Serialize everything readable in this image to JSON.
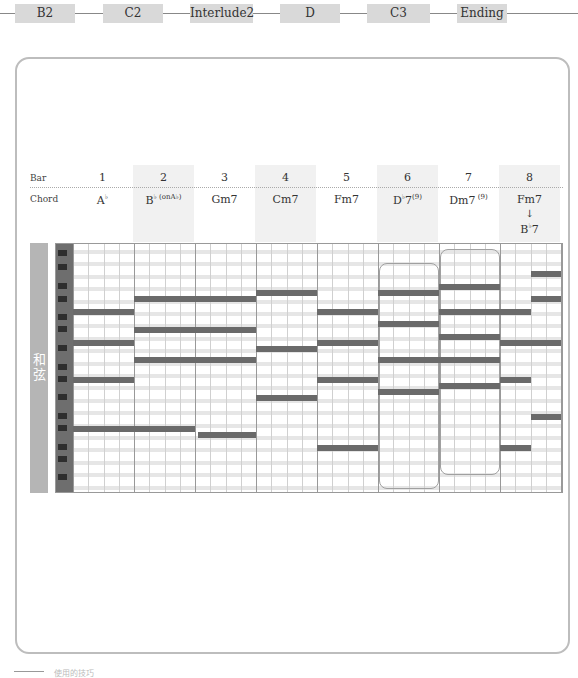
{
  "sections": [
    {
      "label": "B2"
    },
    {
      "label": "C2"
    },
    {
      "label": "Interlude2"
    },
    {
      "label": "D"
    },
    {
      "label": "C3"
    },
    {
      "label": "Ending"
    }
  ],
  "table": {
    "bar_label": "Bar",
    "chord_label": "Chord",
    "bars": [
      {
        "number": "1",
        "chord": "A",
        "chord_acc": "♭",
        "chord_ext": "",
        "shaded": false
      },
      {
        "number": "2",
        "chord": "B",
        "chord_acc": "♭",
        "chord_ext": "(onA♭)",
        "shaded": true
      },
      {
        "number": "3",
        "chord": "Gm7",
        "chord_acc": "",
        "chord_ext": "",
        "shaded": false
      },
      {
        "number": "4",
        "chord": "Cm7",
        "chord_acc": "",
        "chord_ext": "",
        "shaded": true
      },
      {
        "number": "5",
        "chord": "Fm7",
        "chord_acc": "",
        "chord_ext": "",
        "shaded": false
      },
      {
        "number": "6",
        "chord": "D",
        "chord_acc": "♭",
        "chord_ext": "7 (9)",
        "shaded": true
      },
      {
        "number": "7",
        "chord": "Dm7",
        "chord_acc": "",
        "chord_ext": "(9)",
        "shaded": false
      },
      {
        "number": "8",
        "chord": "Fm7",
        "chord_acc": "",
        "chord_ext": "",
        "shaded": true,
        "second_chord": "B♭7",
        "arrow": "↓"
      }
    ]
  },
  "piano_roll": {
    "side_label": "和弦",
    "accent_color": "#6a6a6a",
    "notes": [
      {
        "bar": 1,
        "start": 0,
        "len": 1,
        "y": 68
      },
      {
        "bar": 1,
        "start": 0,
        "len": 1,
        "y": 99
      },
      {
        "bar": 1,
        "start": 0,
        "len": 1,
        "y": 136
      },
      {
        "bar": 1,
        "start": 0,
        "len": 2,
        "y": 185
      },
      {
        "bar": 2,
        "start": 0,
        "len": 1,
        "y": 55
      },
      {
        "bar": 2,
        "start": 0,
        "len": 2,
        "y": 86
      },
      {
        "bar": 2,
        "start": 0,
        "len": 2,
        "y": 116
      },
      {
        "bar": 3,
        "start": 0,
        "len": 1,
        "y": 55
      },
      {
        "bar": 3,
        "start": 0.05,
        "len": 0.95,
        "y": 191
      },
      {
        "bar": 4,
        "start": 0,
        "len": 1,
        "y": 49
      },
      {
        "bar": 4,
        "start": 0,
        "len": 1,
        "y": 105
      },
      {
        "bar": 4,
        "start": 0,
        "len": 1,
        "y": 154
      },
      {
        "bar": 5,
        "start": 0,
        "len": 1,
        "y": 68
      },
      {
        "bar": 5,
        "start": 0,
        "len": 1,
        "y": 99
      },
      {
        "bar": 5,
        "start": 0,
        "len": 1,
        "y": 136
      },
      {
        "bar": 5,
        "start": 0,
        "len": 1,
        "y": 204
      },
      {
        "bar": 6,
        "start": 0,
        "len": 1,
        "y": 49
      },
      {
        "bar": 6,
        "start": 0,
        "len": 1,
        "y": 80
      },
      {
        "bar": 6,
        "start": 0,
        "len": 1,
        "y": 116
      },
      {
        "bar": 6,
        "start": 0,
        "len": 1,
        "y": 148
      },
      {
        "bar": 7,
        "start": 0,
        "len": 1,
        "y": 43
      },
      {
        "bar": 7,
        "start": 0,
        "len": 1,
        "y": 68
      },
      {
        "bar": 7,
        "start": 0,
        "len": 1,
        "y": 93
      },
      {
        "bar": 7,
        "start": 0,
        "len": 1,
        "y": 116
      },
      {
        "bar": 7,
        "start": 0,
        "len": 1,
        "y": 142
      },
      {
        "bar": 8,
        "start": 0,
        "len": 0.5,
        "y": 68
      },
      {
        "bar": 8,
        "start": 0,
        "len": 0.5,
        "y": 99
      },
      {
        "bar": 8,
        "start": 0,
        "len": 0.5,
        "y": 136
      },
      {
        "bar": 8,
        "start": 0,
        "len": 0.5,
        "y": 204
      },
      {
        "bar": 8,
        "start": 0.5,
        "len": 0.5,
        "y": 30
      },
      {
        "bar": 8,
        "start": 0.5,
        "len": 0.5,
        "y": 55
      },
      {
        "bar": 8,
        "start": 0.5,
        "len": 0.5,
        "y": 99
      },
      {
        "bar": 8,
        "start": 0.5,
        "len": 0.5,
        "y": 173
      }
    ],
    "brackets": [
      {
        "bar": 6,
        "top": 19,
        "bottom": 243
      },
      {
        "bar": 7,
        "top": 5,
        "bottom": 229
      }
    ]
  },
  "footer": {
    "caption": "使用的技巧"
  }
}
